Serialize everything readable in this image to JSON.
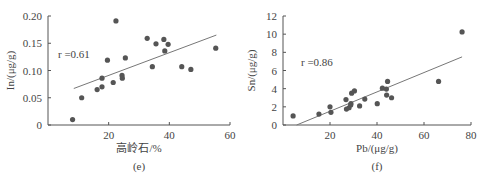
{
  "chart_data": [
    {
      "type": "scatter",
      "panel_label": "(e)",
      "xlabel": "高岭石/%",
      "ylabel": "In/(μg/g)",
      "xlim": [
        0,
        60
      ],
      "ylim": [
        0,
        0.2
      ],
      "xticks": [
        20,
        40,
        60
      ],
      "xtick_labels": [
        "20",
        "40",
        "60"
      ],
      "yticks": [
        0,
        0.05,
        0.1,
        0.15,
        0.2
      ],
      "ytick_labels": [
        "0",
        "0.05",
        "0.10",
        "0.15",
        "0.20"
      ],
      "grid": false,
      "annotation": "r =0.61",
      "trendline": {
        "x": [
          8.5,
          55.5
        ],
        "y": [
          0.067,
          0.165
        ]
      },
      "points": [
        [
          8.1,
          0.01
        ],
        [
          11.1,
          0.05
        ],
        [
          16.2,
          0.065
        ],
        [
          17.8,
          0.07
        ],
        [
          17.8,
          0.086
        ],
        [
          19.6,
          0.119
        ],
        [
          21.5,
          0.078
        ],
        [
          22.4,
          0.191
        ],
        [
          24.4,
          0.091
        ],
        [
          24.5,
          0.086
        ],
        [
          25.5,
          0.123
        ],
        [
          32.7,
          0.159
        ],
        [
          34.4,
          0.107
        ],
        [
          35.6,
          0.149
        ],
        [
          38.2,
          0.157
        ],
        [
          38.5,
          0.136
        ],
        [
          39.6,
          0.148
        ],
        [
          44.1,
          0.107
        ],
        [
          47.1,
          0.102
        ],
        [
          55.3,
          0.141
        ]
      ]
    },
    {
      "type": "scatter",
      "panel_label": "(f)",
      "xlabel": "Pb/(μg/g)",
      "ylabel": "Sn/(μg/g)",
      "xlim": [
        0,
        80
      ],
      "ylim": [
        0,
        12
      ],
      "xticks": [
        20,
        40,
        60,
        80
      ],
      "xtick_labels": [
        "20",
        "40",
        "60",
        "80"
      ],
      "yticks": [
        0,
        2,
        4,
        6,
        8,
        10,
        12
      ],
      "ytick_labels": [
        "0",
        "2",
        "4",
        "6",
        "8",
        "10",
        "12"
      ],
      "grid": false,
      "annotation": "r =0.86",
      "trendline": {
        "x": [
          5.8,
          76.2
        ],
        "y": [
          0,
          7.5
        ]
      },
      "points": [
        [
          4.3,
          1.0
        ],
        [
          15.3,
          1.2
        ],
        [
          20.0,
          2.0
        ],
        [
          20.4,
          1.4
        ],
        [
          26.8,
          2.8
        ],
        [
          27.0,
          1.75
        ],
        [
          28.1,
          1.9
        ],
        [
          28.8,
          2.2
        ],
        [
          28.9,
          2.35
        ],
        [
          29.2,
          3.5
        ],
        [
          30.4,
          3.75
        ],
        [
          32.6,
          2.1
        ],
        [
          34.8,
          2.85
        ],
        [
          40.1,
          2.35
        ],
        [
          42.3,
          4.05
        ],
        [
          44.0,
          3.95
        ],
        [
          44.1,
          3.3
        ],
        [
          44.5,
          4.8
        ],
        [
          46.2,
          3.0
        ],
        [
          66.2,
          4.8
        ],
        [
          76.2,
          10.25
        ]
      ]
    }
  ],
  "colors": {
    "axis": "#555555",
    "point": "#555555",
    "trendline": "#777777",
    "text": "#444444"
  }
}
